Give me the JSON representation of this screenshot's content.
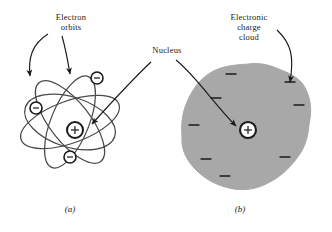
{
  "figure": {
    "background_color": "#ffffff",
    "ink_color": "#1a1a1a",
    "cloud_color": "#a8a8a8",
    "width": 332,
    "height": 232
  },
  "labels": {
    "electron_orbits": "Electron\norbits",
    "nucleus": "Nucleus",
    "electronic_charge_cloud": "Electronic\ncharge\ncloud"
  },
  "captions": {
    "panel_a": "(a)",
    "panel_b": "(b)"
  },
  "panel_a": {
    "name": "bohr-rutherford-orbital-model",
    "nucleus": {
      "symbol": "+",
      "cx": 75,
      "cy": 130,
      "r": 8
    },
    "electrons": [
      {
        "symbol": "−",
        "cx": 97,
        "cy": 78,
        "r": 6
      },
      {
        "symbol": "−",
        "cx": 36,
        "cy": 108,
        "r": 6
      },
      {
        "symbol": "−",
        "cx": 70,
        "cy": 157,
        "r": 6
      }
    ],
    "orbit_count": 3,
    "orbits": [
      {
        "rx": 50,
        "ry": 20,
        "rotate": -18
      },
      {
        "rx": 48,
        "ry": 19,
        "rotate": 55
      },
      {
        "rx": 47,
        "ry": 18,
        "rotate": 118
      }
    ]
  },
  "panel_b": {
    "name": "electron-charge-cloud-model",
    "nucleus": {
      "symbol": "+",
      "cx": 248,
      "cy": 130,
      "r": 8
    },
    "cloud": {
      "cx": 248,
      "cy": 128,
      "r": 64,
      "fill": "#a8a8a8"
    },
    "charge_marks": [
      {
        "symbol": "−",
        "x": 231,
        "y": 74
      },
      {
        "symbol": "−",
        "x": 290,
        "y": 82
      },
      {
        "symbol": "−",
        "x": 216,
        "y": 98
      },
      {
        "symbol": "−",
        "x": 299,
        "y": 105
      },
      {
        "symbol": "−",
        "x": 194,
        "y": 125
      },
      {
        "symbol": "−",
        "x": 285,
        "y": 157
      },
      {
        "symbol": "−",
        "x": 225,
        "y": 176
      },
      {
        "symbol": "−",
        "x": 206,
        "y": 159
      }
    ],
    "charge_mark_count": 8
  },
  "arrows": [
    {
      "name": "arrow-electron-orbits-left",
      "from": "Electron orbits label",
      "to": "outer orbit (left)"
    },
    {
      "name": "arrow-electron-orbits-right",
      "from": "Electron orbits label",
      "to": "orbit (center)"
    },
    {
      "name": "arrow-nucleus-a",
      "from": "Nucleus label",
      "to": "panel (a) nucleus"
    },
    {
      "name": "arrow-nucleus-b",
      "from": "Nucleus label",
      "to": "panel (b) nucleus"
    },
    {
      "name": "arrow-charge-cloud",
      "from": "Electronic charge cloud label",
      "to": "cloud edge"
    }
  ]
}
